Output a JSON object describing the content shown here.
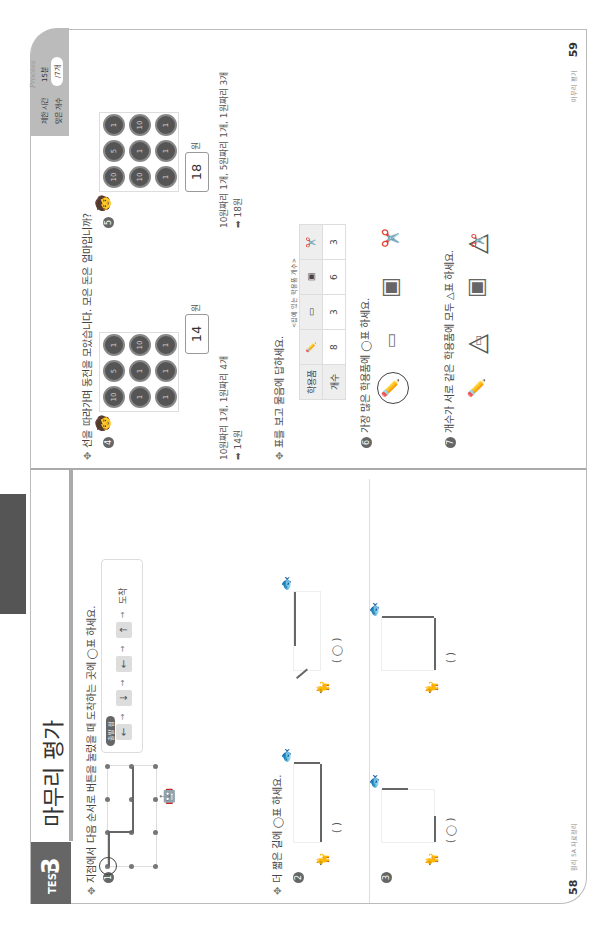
{
  "left_page": {
    "test_label": "TEST",
    "test_number": "3",
    "title": "마무리 평가",
    "q1": {
      "number": "1",
      "prompt": "지점에서 다음 순서로 버튼을 눌렀을 때 도착하는 곳에 ◯표 하세요.",
      "start_badge": "출발 점",
      "commands": [
        "←",
        "↓",
        "←",
        "↑"
      ],
      "goal_label": "도착"
    },
    "q23_prompt": "더 짧은 길에 ◯표 하세요.",
    "q2": {
      "number": "2",
      "options": [
        "(   )",
        "(  ◯  )"
      ]
    },
    "q3": {
      "number": "3",
      "options": [
        "(  ◯  )",
        "(   )"
      ]
    },
    "page_number": "58",
    "footer": "원리 5A 자료정리"
  },
  "right_page": {
    "time_limit_label": "제한 시간",
    "time_limit_value": "15분",
    "correct_label": "맞은 개수",
    "correct_value": "/7개",
    "brand": "Process",
    "q45_prompt": "선을 따라가며 동전을 모았습니다. 모은 돈은 얼마입니까?",
    "q4": {
      "number": "4",
      "coins": [
        [
          "10",
          "5",
          "1"
        ],
        [
          "1",
          "1",
          "10"
        ],
        [
          "1",
          "1",
          "1"
        ]
      ],
      "answer": "14",
      "unit": "원",
      "explanation": "10원짜리 1개, 1원짜리 4개",
      "result": "➡ 14원"
    },
    "q5": {
      "number": "5",
      "coins": [
        [
          "10",
          "5",
          "1"
        ],
        [
          "10",
          "1",
          "10"
        ],
        [
          "1",
          "1",
          "1"
        ]
      ],
      "answer": "18",
      "unit": "원",
      "explanation": "10원짜리 1개, 5원짜리 1개, 1원짜리 3개",
      "result": "➡ 18원"
    },
    "q67_prompt": "표를 보고 물음에 답하세요.",
    "table": {
      "caption": "<집에 있는 학용품 개수>",
      "header_label": "학용품",
      "count_label": "개수",
      "items": [
        "연필",
        "지우개",
        "필통",
        "가위"
      ],
      "counts": [
        "8",
        "3",
        "6",
        "3"
      ]
    },
    "q6": {
      "number": "6",
      "prompt": "가장 많은 학용품에 ◯표 하세요.",
      "answer": "연필"
    },
    "q7": {
      "number": "7",
      "prompt": "개수가 서로 같은 학용품에 모두 △표 하세요.",
      "answer": [
        "지우개",
        "가위"
      ]
    },
    "page_number": "59",
    "footer": "마무리 평가"
  }
}
